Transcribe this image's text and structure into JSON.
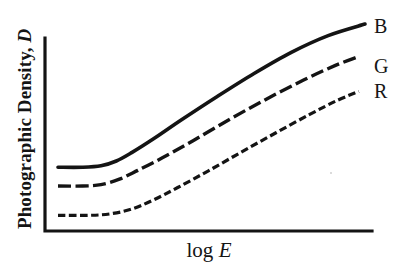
{
  "figure": {
    "background_color": "#ffffff",
    "ink_color": "#141414"
  },
  "axes": {
    "y_label_prefix": "Photographic Density, ",
    "y_label_symbol": "D",
    "x_label_prefix": "log ",
    "x_label_symbol": "E"
  },
  "curve_labels": {
    "blue": "B",
    "green": "G",
    "red": "R"
  },
  "chart_data": {
    "type": "line",
    "title": "",
    "subtitle": "",
    "xlabel": "log E",
    "ylabel": "Photographic Density, D",
    "xticks": [],
    "yticks": [],
    "xticklabels": [],
    "yticklabels": [],
    "grid": false,
    "legend_position": "right-of-curve-ends",
    "axis_style": "L-shaped spine, no tick marks, no numeric scale",
    "xlim": [
      0,
      1
    ],
    "ylim": [
      0,
      1
    ],
    "annotations": [
      "B = blue-sensitive layer (solid line, highest density)",
      "G = green-sensitive layer (long-dashed line, middle density)",
      "R = red-sensitive layer (short-dashed line, lowest density)"
    ],
    "series": [
      {
        "name": "B",
        "label": "B",
        "linestyle": "solid",
        "linewidth": 3.6,
        "color": "#141414",
        "x": [
          0.0,
          0.08,
          0.14,
          0.19,
          0.24,
          0.31,
          0.4,
          0.52,
          0.64,
          0.76,
          0.88,
          1.0
        ],
        "y": [
          0.305,
          0.305,
          0.312,
          0.335,
          0.375,
          0.44,
          0.53,
          0.645,
          0.755,
          0.855,
          0.935,
          0.99
        ]
      },
      {
        "name": "G",
        "label": "G",
        "linestyle": "long-dash",
        "linewidth": 3.4,
        "color": "#141414",
        "x": [
          0.0,
          0.08,
          0.14,
          0.2,
          0.26,
          0.34,
          0.44,
          0.56,
          0.68,
          0.8,
          0.9,
          0.98
        ],
        "y": [
          0.215,
          0.215,
          0.222,
          0.248,
          0.29,
          0.35,
          0.432,
          0.535,
          0.632,
          0.722,
          0.79,
          0.835
        ]
      },
      {
        "name": "R",
        "label": "R",
        "linestyle": "short-dash",
        "linewidth": 3.2,
        "color": "#141414",
        "x": [
          0.0,
          0.1,
          0.17,
          0.24,
          0.31,
          0.39,
          0.49,
          0.6,
          0.71,
          0.82,
          0.91,
          0.98
        ],
        "y": [
          0.075,
          0.075,
          0.082,
          0.105,
          0.148,
          0.208,
          0.288,
          0.38,
          0.47,
          0.558,
          0.625,
          0.668
        ]
      }
    ]
  }
}
